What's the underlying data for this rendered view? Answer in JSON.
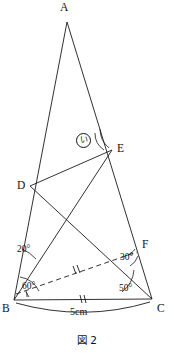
{
  "figure": {
    "caption": "図 2",
    "vertices": [
      {
        "id": "A",
        "label": "A",
        "x": 67,
        "y": 22,
        "lx": 60,
        "ly": 2
      },
      {
        "id": "B",
        "label": "B",
        "x": 14,
        "y": 300,
        "lx": 2,
        "ly": 303
      },
      {
        "id": "C",
        "label": "C",
        "x": 152,
        "y": 299,
        "lx": 157,
        "ly": 303
      },
      {
        "id": "D",
        "label": "D",
        "x": 30,
        "y": 186,
        "lx": 17,
        "ly": 180
      },
      {
        "id": "E",
        "label": "E",
        "x": 112,
        "y": 150,
        "lx": 117,
        "ly": 143
      },
      {
        "id": "F",
        "label": "F",
        "x": 139,
        "y": 249,
        "lx": 142,
        "ly": 239
      }
    ],
    "segments": [
      {
        "name": "side-ab",
        "from": "A",
        "to": "B",
        "style": "solid"
      },
      {
        "name": "side-ac",
        "from": "A",
        "to": "C",
        "style": "solid"
      },
      {
        "name": "side-bc",
        "from": "B",
        "to": "C",
        "style": "solid"
      },
      {
        "name": "segment-de",
        "from": "D",
        "to": "E",
        "style": "solid"
      },
      {
        "name": "segment-dc",
        "from": "D",
        "to": "C",
        "style": "solid"
      },
      {
        "name": "segment-be",
        "from": "B",
        "to": "E",
        "style": "solid"
      },
      {
        "name": "segment-bf",
        "from": "B",
        "to": "F",
        "style": "dashed"
      }
    ],
    "angles": [
      {
        "name": "angle-20",
        "value": "20°",
        "lx": 17,
        "ly": 245
      },
      {
        "name": "angle-60",
        "value": "60°",
        "lx": 22,
        "ly": 282
      },
      {
        "name": "angle-50",
        "value": "50°",
        "lx": 119,
        "ly": 284
      },
      {
        "name": "angle-30",
        "value": "30°",
        "lx": 120,
        "ly": 253
      }
    ],
    "marker": {
      "name": "angle-marker-i",
      "value": "い",
      "lx": 76,
      "ly": 133
    },
    "measure": {
      "name": "length-bc",
      "value": "5cm",
      "lx": 70,
      "ly": 307
    },
    "tick_marks": [
      {
        "name": "tick-bc",
        "count": 2
      },
      {
        "name": "tick-bf",
        "count": 2
      },
      {
        "name": "tick-b-angle",
        "count": 1
      }
    ],
    "colors": {
      "stroke": "#1a1a1a",
      "background": "#ffffff",
      "text": "#111111"
    }
  }
}
